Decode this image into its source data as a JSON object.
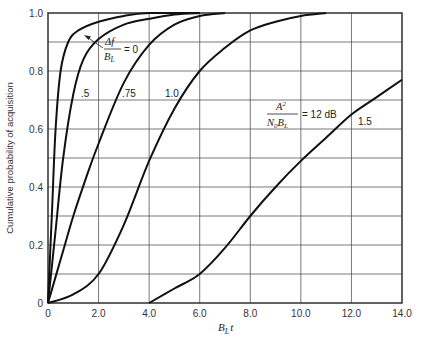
{
  "chart_data": {
    "type": "line",
    "title": "",
    "xlabel": "B_L t",
    "ylabel": "Cumulative probability of acquisition",
    "xlim": [
      0,
      14
    ],
    "ylim": [
      0,
      1.0
    ],
    "grid": true,
    "x_ticks": [
      "0",
      "2.0",
      "4.0",
      "6.0",
      "8.0",
      "10.0",
      "12.0",
      "14.0"
    ],
    "y_ticks": [
      "0",
      "0.2",
      "0.4",
      "0.6",
      "0.8",
      "1.0"
    ],
    "annotations": [
      {
        "text": "Δf / B_L = 0",
        "x": 1.9,
        "y": 0.9
      },
      {
        "text": "A² / (N₀ B_L) = 12 dB",
        "x": 9.5,
        "y": 0.72
      }
    ],
    "series": [
      {
        "name": "0",
        "x": [
          0,
          0.15,
          0.3,
          0.5,
          0.8,
          1.2,
          2.0,
          3.0,
          4.0,
          6.0
        ],
        "y": [
          0,
          0.3,
          0.6,
          0.8,
          0.9,
          0.94,
          0.97,
          0.99,
          1.0,
          1.0
        ]
      },
      {
        "name": ".5",
        "x": [
          0,
          0.3,
          0.6,
          1.0,
          1.4,
          2.0,
          3.0,
          4.0,
          5.0,
          6.0
        ],
        "y": [
          0,
          0.25,
          0.5,
          0.72,
          0.84,
          0.91,
          0.96,
          0.98,
          0.995,
          1.0
        ]
      },
      {
        "name": ".75",
        "x": [
          0,
          0.5,
          1.0,
          1.5,
          2.0,
          3.0,
          4.0,
          5.0,
          6.0,
          7.0
        ],
        "y": [
          0,
          0.15,
          0.3,
          0.43,
          0.55,
          0.76,
          0.89,
          0.96,
          0.99,
          1.0
        ]
      },
      {
        "name": "1.0",
        "x": [
          0,
          1.0,
          2.0,
          3.0,
          4.0,
          5.0,
          6.0,
          7.0,
          8.0,
          9.0,
          10.0,
          11.0
        ],
        "y": [
          0,
          0.03,
          0.1,
          0.27,
          0.49,
          0.67,
          0.8,
          0.88,
          0.94,
          0.97,
          0.99,
          1.0
        ]
      },
      {
        "name": "1.5",
        "x": [
          4.0,
          5.0,
          6.0,
          7.0,
          8.0,
          9.0,
          10.0,
          11.0,
          12.0,
          13.0,
          14.0
        ],
        "y": [
          0,
          0.05,
          0.1,
          0.19,
          0.3,
          0.4,
          0.49,
          0.57,
          0.65,
          0.71,
          0.77
        ]
      }
    ]
  },
  "labels": {
    "ylabel": "Cumulative probability of acquisition",
    "xlabel_main": "B",
    "xlabel_sub": "L",
    "xlabel_t": "t",
    "curve_0_num": "Δf",
    "curve_0_den_main": "B",
    "curve_0_den_sub": "L",
    "curve_0_eq": "= 0",
    "curve_05": ".5",
    "curve_075": ".75",
    "curve_10": "1.0",
    "curve_15": "1.5",
    "snr_num": "A",
    "snr_num_sup": "2",
    "snr_den": "N",
    "snr_den_sub0": "0",
    "snr_den_b": "B",
    "snr_den_sub": "L",
    "snr_eq": "= 12 dB"
  }
}
